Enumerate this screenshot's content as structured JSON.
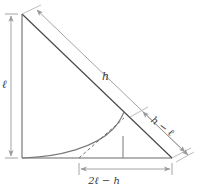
{
  "figure": {
    "type": "geometry-diagram",
    "background_color": "#ffffff",
    "line_color": "#555555",
    "dimension_color": "#9a9a9a",
    "curve_color": "#6f6f6f",
    "text_color": "#3a3a3a"
  },
  "labels": {
    "vertical_leg": "ℓ",
    "hypotenuse": "h",
    "ladder_overhang": "h − ℓ",
    "base_segment": "2ℓ − h"
  },
  "geometry": {
    "apex": {
      "x": 22,
      "y": 14
    },
    "origin": {
      "x": 22,
      "y": 158
    },
    "base_end": {
      "x": 172,
      "y": 158
    },
    "tangent_point": {
      "x": 122,
      "y": 122
    },
    "foot_point": {
      "x": 122,
      "y": 158
    },
    "dash_start": {
      "x": 79,
      "y": 158
    },
    "vertical_dimension": {
      "x": 10,
      "y_top": 16,
      "y_bottom": 157
    },
    "diagonal_dimension_full": {
      "x1": 36,
      "y1": 9,
      "x2": 186,
      "y2": 153
    },
    "diagonal_dimension_partial": {
      "x1": 141,
      "y1": 110,
      "x2": 190,
      "y2": 157
    },
    "base_dimension": {
      "x1": 79,
      "y": 169,
      "x2": 172
    }
  }
}
